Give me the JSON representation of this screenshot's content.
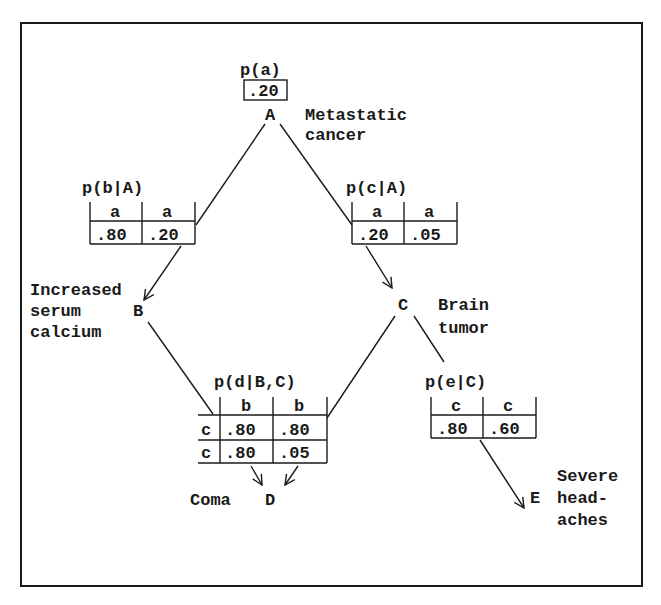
{
  "nodes": {
    "A": {
      "letter": "A",
      "label_line1": "Metastatic",
      "label_line2": "cancer"
    },
    "B": {
      "letter": "B",
      "label_line1": "Increased",
      "label_line2": "serum",
      "label_line3": "calcium"
    },
    "C": {
      "letter": "C",
      "label_line1": "Brain",
      "label_line2": "tumor"
    },
    "D": {
      "letter": "D",
      "label_line1": "Coma"
    },
    "E": {
      "letter": "E",
      "label_line1": "Severe",
      "label_line2": "head-",
      "label_line3": "aches"
    }
  },
  "tables": {
    "pa": {
      "title": "p(a)",
      "value": ".20"
    },
    "pb": {
      "title": "p(b|A)",
      "headers": [
        "a",
        "a"
      ],
      "values": [
        ".80",
        ".20"
      ]
    },
    "pc": {
      "title": "p(c|A)",
      "headers": [
        "a",
        "a"
      ],
      "values": [
        ".20",
        ".05"
      ]
    },
    "pd": {
      "title": "p(d|B,C)",
      "col_headers": [
        "b",
        "b"
      ],
      "row_headers": [
        "c",
        "c"
      ],
      "rows": [
        [
          ".80",
          ".80"
        ],
        [
          ".80",
          ".05"
        ]
      ]
    },
    "pe": {
      "title": "p(e|C)",
      "headers": [
        "c",
        "c"
      ],
      "values": [
        ".80",
        ".60"
      ]
    }
  },
  "colors": {
    "ink": "#1a1a1a",
    "background": "#ffffff"
  }
}
